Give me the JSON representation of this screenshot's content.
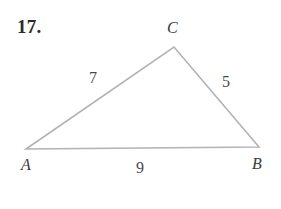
{
  "figure": {
    "problem_number": "17.",
    "type": "triangle-sss",
    "stroke_color": "#b3b3b3",
    "background_color": "#ffffff",
    "text_color": "#3c3c3c",
    "stroke_width": 1.6,
    "vertices": [
      {
        "name": "A",
        "label": "A",
        "x": 26,
        "y": 149
      },
      {
        "name": "B",
        "label": "B",
        "x": 259,
        "y": 147
      },
      {
        "name": "C",
        "label": "C",
        "x": 174,
        "y": 47
      }
    ],
    "sides": [
      {
        "name": "AC",
        "label": "7",
        "from": "A",
        "to": "C",
        "length": 7
      },
      {
        "name": "BC",
        "label": "5",
        "from": "B",
        "to": "C",
        "length": 5
      },
      {
        "name": "AB",
        "label": "9",
        "from": "A",
        "to": "B",
        "length": 9
      }
    ],
    "path": "M 26 149 L 174 47 L 259 147 Z"
  }
}
